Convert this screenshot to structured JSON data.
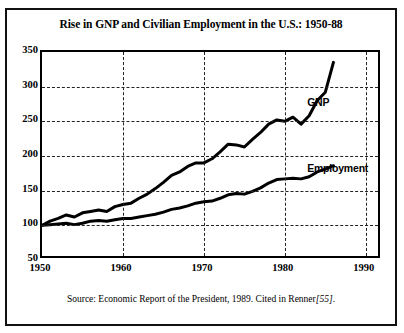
{
  "figure": {
    "title": "Rise in GNP and Civilian Employment in the U.S.: 1950-88",
    "source": "Source: Economic Report of the President, 1989. Cited in Renner",
    "source_citation": "[55]",
    "source_period": "."
  },
  "axes": {
    "y_ticks": [
      "350",
      "300",
      "250",
      "200",
      "150",
      "100",
      "50"
    ],
    "x_ticks": [
      "1950",
      "1960",
      "1970",
      "1980",
      "1990"
    ]
  },
  "labels": {
    "gnp": "GNP",
    "employment": "Employment"
  },
  "colors": {
    "line": "#000000",
    "grid": "#222222",
    "frame": "#111111",
    "background": "#ffffff"
  },
  "chart_data": {
    "type": "line",
    "title": "Rise in GNP and Civilian Employment in the U.S.: 1950-88",
    "xlabel": "",
    "ylabel": "",
    "xlim": [
      1950,
      1992
    ],
    "ylim": [
      50,
      350
    ],
    "ytick_step": 50,
    "grid": "dashed",
    "legend": "inline-labels",
    "note": "Index values, 1950 = 100",
    "series": [
      {
        "name": "GNP",
        "label_x": 1983,
        "label_y": 275,
        "x": [
          1950,
          1951,
          1952,
          1953,
          1954,
          1955,
          1956,
          1957,
          1958,
          1959,
          1960,
          1961,
          1962,
          1963,
          1964,
          1965,
          1966,
          1967,
          1968,
          1969,
          1970,
          1971,
          1972,
          1973,
          1974,
          1975,
          1976,
          1977,
          1978,
          1979,
          1980,
          1981,
          1982,
          1983,
          1984,
          1985,
          1986
        ],
        "y": [
          100,
          106,
          110,
          115,
          112,
          118,
          120,
          122,
          120,
          127,
          130,
          132,
          139,
          145,
          153,
          162,
          172,
          177,
          185,
          190,
          190,
          196,
          206,
          217,
          216,
          213,
          224,
          234,
          246,
          252,
          250,
          256,
          246,
          258,
          280,
          292,
          335
        ]
      },
      {
        "name": "Employment",
        "label_x": 1983,
        "label_y": 180,
        "x": [
          1950,
          1951,
          1952,
          1953,
          1954,
          1955,
          1956,
          1957,
          1958,
          1959,
          1960,
          1961,
          1962,
          1963,
          1964,
          1965,
          1966,
          1967,
          1968,
          1969,
          1970,
          1971,
          1972,
          1973,
          1974,
          1975,
          1976,
          1977,
          1978,
          1979,
          1980,
          1981,
          1982,
          1983,
          1984,
          1985,
          1986
        ],
        "y": [
          100,
          101,
          102,
          103,
          101,
          103,
          106,
          107,
          106,
          108,
          110,
          110,
          112,
          114,
          116,
          119,
          123,
          125,
          128,
          132,
          134,
          135,
          139,
          144,
          146,
          145,
          149,
          154,
          161,
          166,
          167,
          168,
          167,
          170,
          177,
          181,
          186
        ]
      }
    ]
  }
}
